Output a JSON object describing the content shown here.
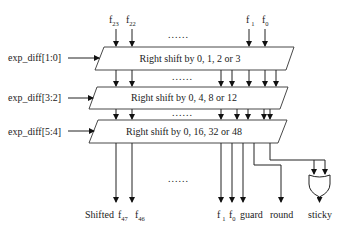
{
  "diagram": {
    "inputs_top": [
      {
        "name": "f",
        "sub": "23"
      },
      {
        "name": "f",
        "sub": "22"
      },
      {
        "name": "f",
        "sub": "1"
      },
      {
        "name": "f",
        "sub": "0"
      }
    ],
    "ellipsis": "......",
    "stages": [
      {
        "control": "exp_diff[1:0]",
        "label": "Right shift by 0, 1, 2 or 3"
      },
      {
        "control": "exp_diff[3:2]",
        "label": "Right shift by 0, 4, 8 or 12"
      },
      {
        "control": "exp_diff[5:4]",
        "label": "Right shift by 0, 16, 32 or 48"
      }
    ],
    "outputs": {
      "shifted_label": "Shifted",
      "bits": [
        {
          "name": "f",
          "sub": "47"
        },
        {
          "name": "f",
          "sub": "46"
        },
        {
          "name": "f",
          "sub": "1"
        },
        {
          "name": "f",
          "sub": "0"
        }
      ],
      "guard": "guard",
      "round": "round",
      "sticky": "sticky"
    },
    "gate": "OR"
  }
}
